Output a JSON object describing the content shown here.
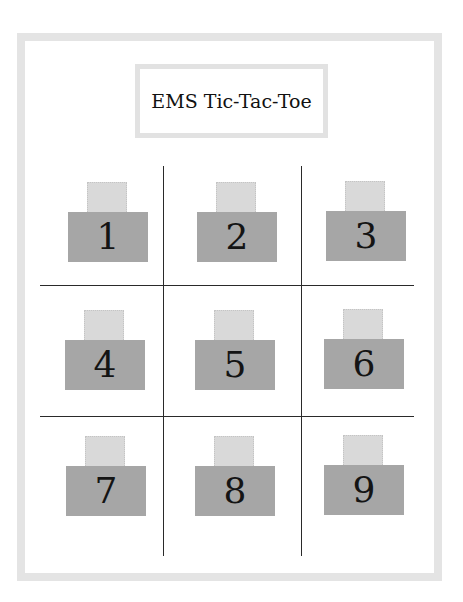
{
  "title": "EMS Tic-Tac-Toe",
  "colors": {
    "frame_border": "#e4e4e4",
    "title_border": "#e2e2e2",
    "tab": "#d9d9d9",
    "box": "#a6a6a6",
    "grid_line": "#2a2a2a"
  },
  "board": {
    "cells": [
      {
        "label": "1"
      },
      {
        "label": "2"
      },
      {
        "label": "3"
      },
      {
        "label": "4"
      },
      {
        "label": "5"
      },
      {
        "label": "6"
      },
      {
        "label": "7"
      },
      {
        "label": "8"
      },
      {
        "label": "9"
      }
    ]
  }
}
